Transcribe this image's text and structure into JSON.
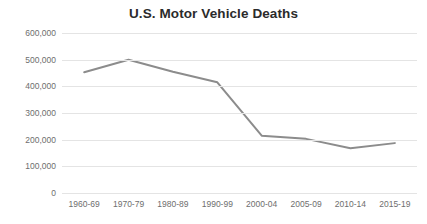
{
  "chart_data": {
    "type": "line",
    "title": "U.S. Motor Vehicle Deaths",
    "xlabel": "",
    "ylabel": "",
    "categories": [
      "1960-69",
      "1970-79",
      "1980-89",
      "1990-99",
      "2000-04",
      "2005-09",
      "2010-14",
      "2015-19"
    ],
    "values": [
      453000,
      500000,
      455000,
      415000,
      215000,
      203000,
      168000,
      187000
    ],
    "series": [
      {
        "name": "U.S. Motor Vehicle Deaths",
        "values": [
          453000,
          500000,
          455000,
          415000,
          215000,
          203000,
          168000,
          187000
        ]
      }
    ],
    "ylim": [
      0,
      600000
    ],
    "y_ticks": [
      0,
      100000,
      200000,
      300000,
      400000,
      500000,
      600000
    ],
    "y_tick_labels": [
      "0",
      "100,000",
      "200,000",
      "300,000",
      "400,000",
      "500,000",
      "600,000"
    ],
    "grid": true,
    "legend": false,
    "legend_position": "none",
    "colors": {
      "line": "#8c8c8c",
      "grid": "#e4e4e4",
      "title": "#2b2b2b",
      "tick_label": "#6e6e6e",
      "background": "#ffffff"
    }
  }
}
